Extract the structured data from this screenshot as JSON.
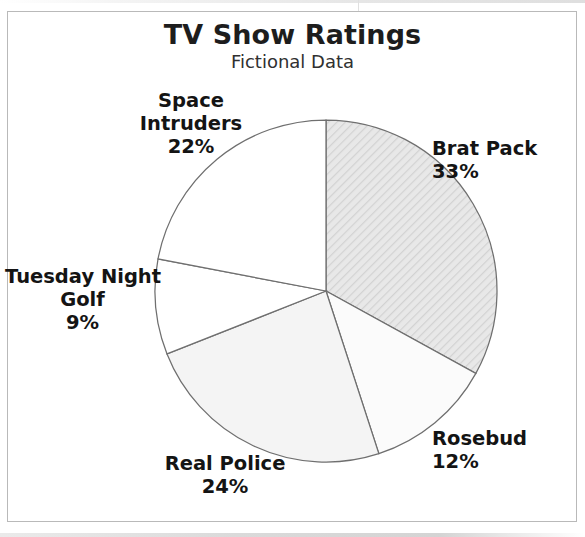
{
  "figure": {
    "title": "TV Show Ratings",
    "subtitle": "Fictional Data",
    "frame_color": "#b9b9b9",
    "background": "#ffffff",
    "text_color": "#141414"
  },
  "chart_data": {
    "type": "pie",
    "title": "TV Show Ratings",
    "subtitle": "Fictional Data",
    "xlabel": "",
    "ylabel": "",
    "legend": "none",
    "grid": false,
    "start_angle_deg": 0,
    "direction": "clockwise",
    "units": "percent",
    "total": 100,
    "categories": [
      "Brat Pack",
      "Rosebud",
      "Real Police",
      "Tuesday Night Golf",
      "Space Intruders"
    ],
    "values": [
      33,
      12,
      24,
      9,
      22
    ],
    "slices": [
      {
        "name": "Brat Pack",
        "label_lines": [
          "Brat Pack"
        ],
        "value": 33,
        "value_label": "33%",
        "fill": "#e4e4e4",
        "pattern": "diagonal-hatch",
        "stroke": "#6f6f6f"
      },
      {
        "name": "Rosebud",
        "label_lines": [
          "Rosebud"
        ],
        "value": 12,
        "value_label": "12%",
        "fill": "#fbfbfb",
        "pattern": "none",
        "stroke": "#6f6f6f"
      },
      {
        "name": "Real Police",
        "label_lines": [
          "Real Police"
        ],
        "value": 24,
        "value_label": "24%",
        "fill": "#f4f4f4",
        "pattern": "none",
        "stroke": "#6f6f6f"
      },
      {
        "name": "Tuesday Night Golf",
        "label_lines": [
          "Tuesday Night",
          "Golf"
        ],
        "value": 9,
        "value_label": "9%",
        "fill": "#ffffff",
        "pattern": "none",
        "stroke": "#6f6f6f"
      },
      {
        "name": "Space Intruders",
        "label_lines": [
          "Space",
          "Intruders"
        ],
        "value": 22,
        "value_label": "22%",
        "fill": "#ffffff",
        "pattern": "none",
        "stroke": "#6f6f6f"
      }
    ],
    "geometry": {
      "center_x": 326,
      "center_y": 291,
      "radius": 171
    }
  }
}
